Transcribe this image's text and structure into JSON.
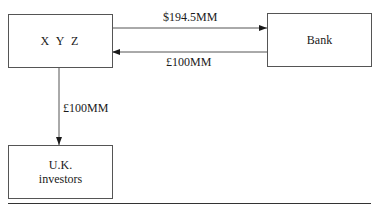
{
  "diagram": {
    "nodes": [
      {
        "id": "xyz",
        "label": "X Y Z"
      },
      {
        "id": "bank",
        "label": "Bank"
      },
      {
        "id": "uk_investors",
        "label_line1": "U.K.",
        "label_line2": "investors"
      }
    ],
    "edges": [
      {
        "from": "xyz",
        "to": "bank",
        "label": "$194.5MM"
      },
      {
        "from": "bank",
        "to": "xyz",
        "label": "£100MM"
      },
      {
        "from": "xyz",
        "to": "uk_investors",
        "label": "£100MM"
      }
    ]
  }
}
